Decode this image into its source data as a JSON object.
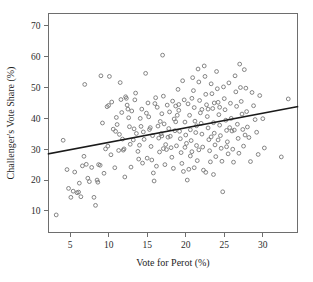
{
  "chart_data": {
    "type": "scatter",
    "title": "",
    "xlabel": "Vote for Perot (%)",
    "ylabel": "Challenger's Vote Share (%)",
    "xlim": [
      2.2,
      34.5
    ],
    "ylim": [
      3,
      74
    ],
    "xticks": [
      5,
      10,
      15,
      20,
      25,
      30
    ],
    "yticks": [
      10,
      20,
      30,
      40,
      50,
      60,
      70
    ],
    "xtick_labels": [
      "5",
      "10",
      "15",
      "20",
      "25",
      "30"
    ],
    "ytick_labels": [
      "10",
      "20",
      "30",
      "40",
      "50",
      "60",
      "70"
    ],
    "grid": false,
    "legend": "none",
    "marker": "open-circle",
    "marker_color": "#777777",
    "trendline": {
      "label": "linear fit",
      "color": "#1a1a1a",
      "x_start": 2.2,
      "y_start": 28.5,
      "x_end": 34.5,
      "y_end": 43.8
    },
    "points": [
      [
        3.2,
        8.7
      ],
      [
        4.1,
        32.9
      ],
      [
        4.6,
        23.4
      ],
      [
        4.8,
        17.3
      ],
      [
        5.1,
        14.4
      ],
      [
        5.4,
        16.4
      ],
      [
        5.6,
        22.6
      ],
      [
        5.9,
        15.9
      ],
      [
        6.1,
        16.1
      ],
      [
        6.2,
        19.0
      ],
      [
        6.4,
        14.6
      ],
      [
        6.6,
        24.6
      ],
      [
        6.8,
        27.7
      ],
      [
        6.9,
        51.0
      ],
      [
        7.1,
        25.1
      ],
      [
        7.3,
        20.6
      ],
      [
        7.5,
        19.5
      ],
      [
        7.8,
        24.1
      ],
      [
        8.1,
        14.4
      ],
      [
        8.3,
        11.8
      ],
      [
        8.5,
        20.0
      ],
      [
        8.6,
        19.3
      ],
      [
        8.7,
        25.0
      ],
      [
        8.9,
        24.8
      ],
      [
        9.0,
        53.8
      ],
      [
        9.2,
        38.5
      ],
      [
        9.4,
        22.2
      ],
      [
        9.6,
        30.1
      ],
      [
        9.8,
        43.8
      ],
      [
        10.0,
        44.2
      ],
      [
        10.1,
        53.6
      ],
      [
        10.3,
        28.2
      ],
      [
        10.4,
        45.3
      ],
      [
        10.6,
        36.5
      ],
      [
        10.8,
        24.0
      ],
      [
        11.0,
        40.3
      ],
      [
        11.1,
        38.0
      ],
      [
        11.3,
        29.6
      ],
      [
        11.5,
        51.6
      ],
      [
        11.6,
        46.1
      ],
      [
        11.8,
        33.3
      ],
      [
        11.9,
        29.7
      ],
      [
        12.0,
        30.1
      ],
      [
        12.2,
        47.0
      ],
      [
        12.3,
        46.5
      ],
      [
        12.4,
        44.3
      ],
      [
        12.6,
        40.2
      ],
      [
        12.8,
        31.6
      ],
      [
        12.9,
        24.2
      ],
      [
        13.0,
        42.4
      ],
      [
        13.2,
        33.0
      ],
      [
        13.3,
        36.6
      ],
      [
        13.5,
        48.2
      ],
      [
        13.6,
        35.1
      ],
      [
        13.8,
        29.3
      ],
      [
        14.0,
        31.3
      ],
      [
        14.1,
        40.0
      ],
      [
        14.3,
        43.0
      ],
      [
        14.5,
        35.6
      ],
      [
        14.6,
        33.2
      ],
      [
        14.8,
        54.6
      ],
      [
        15.0,
        27.1
      ],
      [
        15.1,
        45.0
      ],
      [
        15.2,
        40.5
      ],
      [
        15.4,
        37.0
      ],
      [
        15.5,
        30.9
      ],
      [
        15.6,
        26.5
      ],
      [
        15.8,
        22.3
      ],
      [
        15.9,
        19.7
      ],
      [
        16.0,
        44.8
      ],
      [
        16.1,
        46.7
      ],
      [
        16.3,
        43.6
      ],
      [
        16.4,
        37.5
      ],
      [
        16.5,
        33.6
      ],
      [
        16.6,
        29.1
      ],
      [
        16.8,
        35.0
      ],
      [
        16.9,
        41.5
      ],
      [
        17.0,
        60.5
      ],
      [
        17.1,
        47.2
      ],
      [
        17.2,
        38.2
      ],
      [
        17.4,
        31.5
      ],
      [
        17.5,
        29.9
      ],
      [
        17.6,
        44.3
      ],
      [
        17.8,
        36.7
      ],
      [
        17.9,
        42.1
      ],
      [
        18.0,
        34.2
      ],
      [
        18.1,
        30.5
      ],
      [
        18.2,
        27.4
      ],
      [
        18.3,
        45.6
      ],
      [
        18.5,
        39.8
      ],
      [
        18.6,
        36.0
      ],
      [
        18.7,
        44.0
      ],
      [
        18.8,
        31.1
      ],
      [
        19.0,
        49.4
      ],
      [
        19.1,
        42.6
      ],
      [
        19.2,
        35.8
      ],
      [
        19.3,
        33.4
      ],
      [
        19.4,
        28.9
      ],
      [
        19.5,
        25.4
      ],
      [
        19.6,
        52.2
      ],
      [
        19.8,
        46.0
      ],
      [
        19.9,
        38.8
      ],
      [
        20.0,
        34.6
      ],
      [
        20.1,
        31.9
      ],
      [
        20.2,
        20.0
      ],
      [
        20.3,
        44.7
      ],
      [
        20.5,
        41.0
      ],
      [
        20.6,
        36.3
      ],
      [
        20.7,
        32.8
      ],
      [
        20.8,
        29.2
      ],
      [
        20.9,
        53.2
      ],
      [
        21.0,
        49.0
      ],
      [
        21.1,
        43.5
      ],
      [
        21.2,
        39.1
      ],
      [
        21.3,
        35.4
      ],
      [
        21.4,
        31.2
      ],
      [
        21.5,
        26.3
      ],
      [
        21.6,
        56.0
      ],
      [
        21.7,
        51.8
      ],
      [
        21.8,
        45.8
      ],
      [
        21.9,
        41.8
      ],
      [
        22.0,
        38.4
      ],
      [
        22.1,
        34.9
      ],
      [
        22.2,
        30.7
      ],
      [
        22.3,
        23.2
      ],
      [
        22.4,
        57.0
      ],
      [
        22.5,
        53.6
      ],
      [
        22.6,
        47.8
      ],
      [
        22.7,
        44.4
      ],
      [
        22.8,
        40.6
      ],
      [
        22.9,
        36.9
      ],
      [
        23.0,
        33.1
      ],
      [
        23.1,
        29.5
      ],
      [
        23.2,
        25.9
      ],
      [
        23.3,
        51.2
      ],
      [
        23.4,
        48.0
      ],
      [
        23.5,
        43.2
      ],
      [
        23.6,
        38.6
      ],
      [
        23.7,
        35.2
      ],
      [
        23.8,
        31.4
      ],
      [
        23.9,
        27.6
      ],
      [
        24.0,
        55.2
      ],
      [
        24.1,
        49.6
      ],
      [
        24.2,
        45.2
      ],
      [
        24.3,
        41.2
      ],
      [
        24.4,
        37.8
      ],
      [
        24.5,
        34.4
      ],
      [
        24.6,
        30.3
      ],
      [
        24.7,
        26.1
      ],
      [
        24.8,
        16.2
      ],
      [
        24.9,
        50.2
      ],
      [
        25.0,
        46.4
      ],
      [
        25.1,
        42.8
      ],
      [
        25.2,
        39.4
      ],
      [
        25.3,
        36.1
      ],
      [
        25.4,
        32.4
      ],
      [
        25.5,
        28.5
      ],
      [
        25.6,
        51.5
      ],
      [
        25.8,
        44.9
      ],
      [
        25.9,
        40.0
      ],
      [
        26.0,
        35.9
      ],
      [
        26.1,
        30.0
      ],
      [
        26.2,
        25.8
      ],
      [
        26.4,
        53.8
      ],
      [
        26.5,
        48.6
      ],
      [
        26.6,
        43.9
      ],
      [
        26.7,
        38.1
      ],
      [
        26.8,
        33.5
      ],
      [
        26.9,
        28.7
      ],
      [
        27.0,
        57.6
      ],
      [
        27.1,
        50.0
      ],
      [
        27.2,
        45.5
      ],
      [
        27.3,
        41.4
      ],
      [
        27.4,
        36.4
      ],
      [
        27.5,
        31.0
      ],
      [
        27.6,
        55.8
      ],
      [
        27.8,
        49.8
      ],
      [
        27.9,
        42.2
      ],
      [
        28.0,
        37.2
      ],
      [
        28.2,
        33.8
      ],
      [
        28.4,
        26.0
      ],
      [
        28.6,
        48.4
      ],
      [
        28.8,
        44.1
      ],
      [
        29.0,
        39.6
      ],
      [
        29.2,
        35.5
      ],
      [
        29.4,
        28.3
      ],
      [
        29.6,
        47.4
      ],
      [
        30.0,
        39.9
      ],
      [
        30.2,
        30.4
      ],
      [
        32.4,
        27.5
      ],
      [
        33.3,
        46.3
      ],
      [
        12.1,
        21.0
      ],
      [
        13.9,
        26.8
      ],
      [
        16.2,
        24.5
      ],
      [
        18.4,
        23.8
      ],
      [
        19.7,
        22.8
      ],
      [
        21.1,
        24.0
      ],
      [
        22.6,
        22.5
      ],
      [
        14.4,
        25.5
      ],
      [
        17.3,
        25.0
      ],
      [
        20.4,
        23.5
      ],
      [
        23.6,
        21.8
      ],
      [
        11.4,
        34.8
      ],
      [
        12.7,
        37.3
      ],
      [
        15.7,
        34.4
      ],
      [
        16.7,
        39.0
      ],
      [
        17.7,
        33.9
      ],
      [
        18.9,
        41.0
      ],
      [
        19.9,
        30.6
      ],
      [
        20.8,
        46.5
      ],
      [
        21.4,
        37.6
      ],
      [
        22.1,
        42.9
      ],
      [
        23.3,
        34.0
      ],
      [
        24.4,
        43.6
      ],
      [
        25.7,
        37.0
      ],
      [
        26.3,
        36.2
      ],
      [
        27.7,
        34.6
      ],
      [
        9.9,
        31.0
      ],
      [
        10.9,
        35.8
      ],
      [
        13.4,
        46.0
      ],
      [
        14.9,
        41.7
      ],
      [
        16.9,
        34.3
      ],
      [
        18.7,
        38.9
      ],
      [
        20.6,
        27.8
      ],
      [
        22.9,
        43.0
      ],
      [
        24.2,
        33.0
      ],
      [
        25.3,
        30.8
      ],
      [
        15.3,
        36.4
      ],
      [
        17.1,
        30.2
      ],
      [
        19.1,
        44.5
      ],
      [
        21.7,
        29.8
      ],
      [
        23.7,
        45.0
      ],
      [
        12.5,
        43.0
      ],
      [
        14.2,
        37.4
      ],
      [
        11.7,
        41.9
      ]
    ]
  },
  "axes": {
    "x_axis_name": "vote-for-perot-axis",
    "y_axis_name": "challenger-vote-share-axis"
  }
}
